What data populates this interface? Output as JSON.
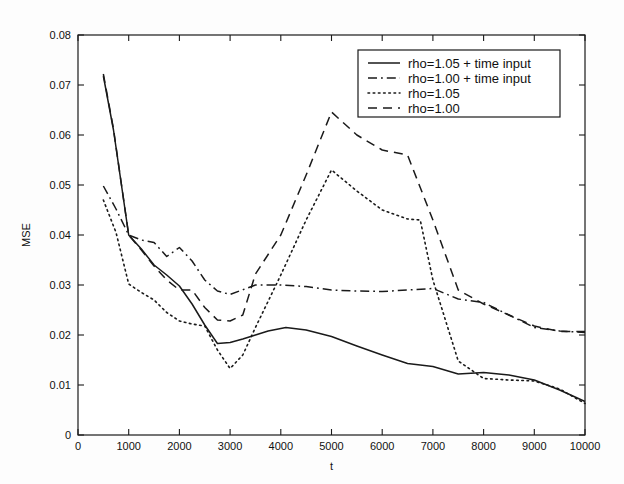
{
  "chart_data": {
    "type": "line",
    "title": "",
    "xlabel": "t",
    "ylabel": "MSE",
    "xlim": [
      0,
      10000
    ],
    "ylim": [
      0,
      0.08
    ],
    "grid": false,
    "legend_position": "top-right",
    "xticks": [
      "0",
      "1000",
      "2000",
      "3000",
      "4000",
      "5000",
      "6000",
      "7000",
      "8000",
      "9000",
      "10000"
    ],
    "xtick_values": [
      0,
      1000,
      2000,
      3000,
      4000,
      5000,
      6000,
      7000,
      8000,
      9000,
      10000
    ],
    "yticks": [
      "0",
      "0.01",
      "0.02",
      "0.03",
      "0.04",
      "0.05",
      "0.06",
      "0.07",
      "0.08"
    ],
    "ytick_values": [
      0,
      0.01,
      0.02,
      0.03,
      0.04,
      0.05,
      0.06,
      0.07,
      0.08
    ],
    "series": [
      {
        "name": "rho=1.05 + time input",
        "style": "solid",
        "color": "#1a1a1a",
        "x": [
          500,
          700,
          1000,
          1250,
          1500,
          1750,
          2000,
          2250,
          2500,
          2750,
          3000,
          3250,
          3500,
          3750,
          4100,
          4500,
          5000,
          5500,
          6000,
          6500,
          7000,
          7500,
          8000,
          8500,
          9000,
          9500,
          10000
        ],
        "y": [
          0.0718,
          0.061,
          0.04,
          0.0372,
          0.034,
          0.032,
          0.0298,
          0.0262,
          0.022,
          0.0183,
          0.0185,
          0.0192,
          0.02,
          0.0208,
          0.0215,
          0.021,
          0.0197,
          0.0178,
          0.016,
          0.0143,
          0.0137,
          0.0122,
          0.0125,
          0.012,
          0.011,
          0.009,
          0.0067
        ]
      },
      {
        "name": "rho=1.00 + time input",
        "style": "dashdot",
        "color": "#1a1a1a",
        "x": [
          500,
          750,
          1000,
          1250,
          1500,
          1750,
          2000,
          2250,
          2500,
          2750,
          3000,
          3500,
          4000,
          4500,
          5000,
          5500,
          6000,
          6500,
          7000,
          7500,
          8000,
          8500,
          9000,
          9500,
          10000
        ],
        "y": [
          0.0498,
          0.0452,
          0.04,
          0.039,
          0.0385,
          0.0357,
          0.0375,
          0.0348,
          0.031,
          0.0288,
          0.0281,
          0.03,
          0.03,
          0.0297,
          0.029,
          0.0288,
          0.0287,
          0.029,
          0.0293,
          0.0272,
          0.0265,
          0.024,
          0.0215,
          0.0208,
          0.0205
        ]
      },
      {
        "name": "rho=1.05",
        "style": "dotted",
        "color": "#1a1a1a",
        "x": [
          500,
          750,
          1000,
          1250,
          1500,
          1750,
          2000,
          2250,
          2500,
          2750,
          3000,
          3250,
          3500,
          4000,
          4500,
          5000,
          5500,
          6000,
          6500,
          6750,
          7000,
          7500,
          8000,
          8500,
          9000,
          9500,
          10000
        ],
        "y": [
          0.047,
          0.0405,
          0.0302,
          0.0285,
          0.027,
          0.0245,
          0.0228,
          0.0222,
          0.0218,
          0.017,
          0.0133,
          0.016,
          0.0215,
          0.032,
          0.043,
          0.053,
          0.0488,
          0.045,
          0.0432,
          0.043,
          0.031,
          0.0148,
          0.0113,
          0.011,
          0.0108,
          0.0092,
          0.0063
        ]
      },
      {
        "name": "rho=1.00",
        "style": "dashed",
        "color": "#1a1a1a",
        "x": [
          500,
          700,
          1000,
          1250,
          1500,
          1750,
          2000,
          2250,
          2500,
          2750,
          3000,
          3250,
          3500,
          4000,
          4500,
          5000,
          5500,
          6000,
          6500,
          7000,
          7500,
          8000,
          8500,
          9000,
          9500,
          10000
        ],
        "y": [
          0.0722,
          0.0612,
          0.04,
          0.037,
          0.0338,
          0.031,
          0.029,
          0.029,
          0.0255,
          0.023,
          0.0228,
          0.024,
          0.0322,
          0.04,
          0.052,
          0.0646,
          0.06,
          0.057,
          0.056,
          0.043,
          0.029,
          0.0262,
          0.024,
          0.0218,
          0.0207,
          0.0207
        ]
      }
    ]
  },
  "legend": {
    "entries": [
      {
        "label": "rho=1.05 + time input"
      },
      {
        "label": "rho=1.00 + time input"
      },
      {
        "label": "rho=1.05"
      },
      {
        "label": "rho=1.00"
      }
    ]
  }
}
